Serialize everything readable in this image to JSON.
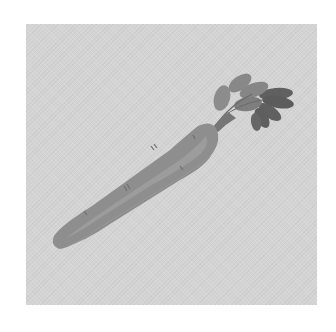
{
  "image": {
    "subject": "carrot",
    "description": "Grayscale illustration of a single carrot with leafy top, lying diagonally on a textured gray square",
    "colors": {
      "page_background": "#ffffff",
      "square_background": "#d4d4d4",
      "carrot_body": "#8e8e8e",
      "carrot_highlight": "#a3a3a3",
      "carrot_shadow": "#7a7a7a",
      "carrot_marks": "#6e6e6e",
      "leaves_light": "#8a8a8a",
      "leaves_dark": "#5f5f5f",
      "stem": "#747474"
    }
  }
}
